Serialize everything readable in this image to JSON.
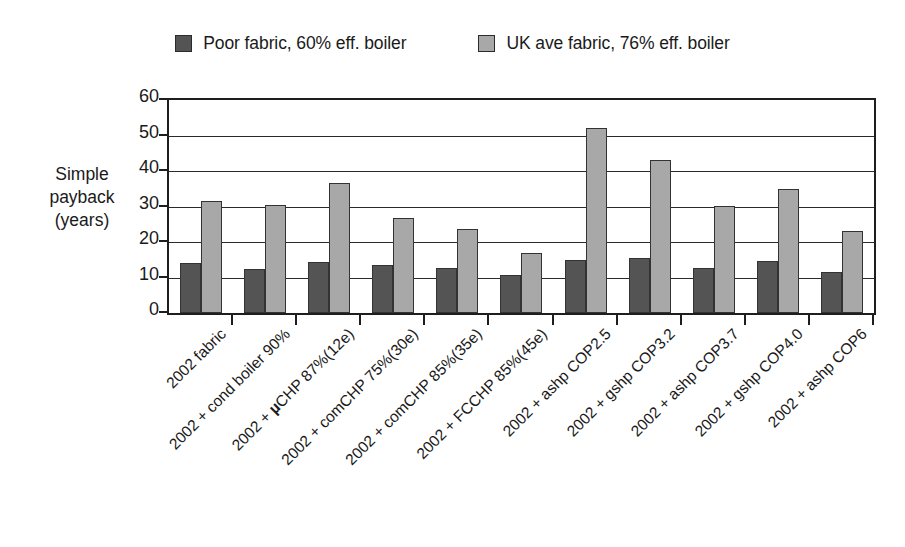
{
  "chart_data": {
    "type": "bar",
    "title": "",
    "xlabel": "",
    "ylabel": "Simple payback (years)",
    "ylabel_lines": [
      "Simple",
      "payback",
      "(years)"
    ],
    "ylim": [
      0,
      60
    ],
    "ytick_values": [
      0,
      10,
      20,
      30,
      40,
      50,
      60
    ],
    "ytick_labels": [
      "0",
      "10",
      "20",
      "30",
      "40",
      "50",
      "60"
    ],
    "grid": true,
    "legend_position": "top",
    "categories": [
      "2002 fabric",
      "2002 + cond boiler 90%",
      "2002 + µCHP 87%(12e)",
      "2002 + comCHP 75%(30e)",
      "2002 + comCHP 85%(35e)",
      "2002 + FCCHP 85%(45e)",
      "2002 + ashp COP2.5",
      "2002 + gshp COP3.2",
      "2002 + ashp COP3.7",
      "2002 + gshp COP4.0",
      "2002 + ashp COP6"
    ],
    "series": [
      {
        "name": "Poor fabric, 60% eff. boiler",
        "color": "#545454",
        "values": [
          14.0,
          12.3,
          14.3,
          13.5,
          12.8,
          10.8,
          14.8,
          15.6,
          12.8,
          14.7,
          11.6
        ]
      },
      {
        "name": "UK ave fabric, 76% eff. boiler",
        "color": "#a8a8a8",
        "values": [
          31.6,
          30.4,
          36.5,
          26.8,
          23.7,
          17.0,
          52.0,
          43.0,
          30.2,
          34.8,
          23.0
        ]
      }
    ]
  }
}
